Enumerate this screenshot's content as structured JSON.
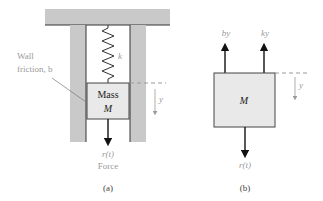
{
  "colors": {
    "support_fill": "#c9c9c9",
    "mass_fill": "#e9e9e9",
    "outline": "#333333",
    "arrow": "#111111",
    "label": "#9a9a9a",
    "mass_text": "#222222"
  },
  "panel_a": {
    "caption": "(a)",
    "wall_label_line1": "Wall",
    "wall_label_line2": "friction, b",
    "spring_label": "k",
    "mass_label_line1": "Mass",
    "mass_label_line2": "M",
    "displacement_label": "y",
    "force_label": "r(t)",
    "force_caption": "Force"
  },
  "panel_b": {
    "caption": "(b)",
    "mass_label": "M",
    "damping_force_label": "by",
    "spring_force_label": "ky",
    "displacement_label": "y",
    "force_label": "r(t)"
  }
}
